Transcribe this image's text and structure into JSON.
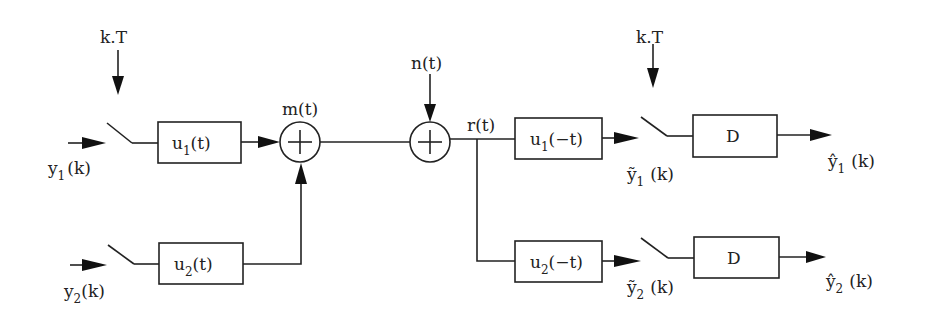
{
  "diagram": {
    "type": "block-diagram",
    "sampling_labels": {
      "transmitter": "k.T",
      "receiver": "k.T"
    },
    "inputs": {
      "y1": {
        "base": "y",
        "sub": "1",
        "arg": "(k)"
      },
      "y2": {
        "base": "y",
        "sub": "2",
        "arg": "(k)"
      }
    },
    "blocks": {
      "u1_tx": {
        "base": "u",
        "sub": "1",
        "arg": "(t)"
      },
      "u2_tx": {
        "base": "u",
        "sub": "2",
        "arg": "(t)"
      },
      "u1_rx": {
        "base": "u",
        "sub": "1",
        "arg": "(−t)"
      },
      "u2_rx": {
        "base": "u",
        "sub": "2",
        "arg": "(−t)"
      },
      "d1": "D",
      "d2": "D"
    },
    "signals": {
      "m": "m(t)",
      "n": "n(t)",
      "r": "r(t)"
    },
    "sample_outputs": {
      "y1_tilde": {
        "base": "ỹ",
        "sub": "1",
        "arg": "(k)"
      },
      "y2_tilde": {
        "base": "ỹ",
        "sub": "2",
        "arg": "(k)"
      }
    },
    "outputs": {
      "y1_hat": {
        "base": "ŷ",
        "sub": "1",
        "arg": "(k)"
      },
      "y2_hat": {
        "base": "ŷ",
        "sub": "2",
        "arg": "(k)"
      }
    },
    "summers": [
      "+",
      "+"
    ]
  }
}
